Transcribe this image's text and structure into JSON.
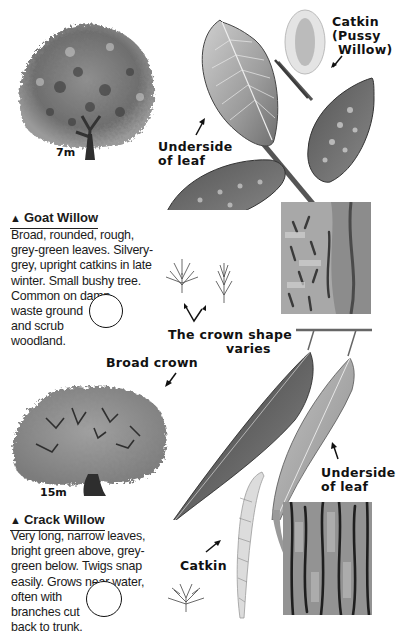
{
  "goat_willow": {
    "size_label": "7m",
    "title_marker": "▲",
    "title": "Goat Willow",
    "description_lines": [
      "Broad, rounded, rough,",
      "grey-green leaves. Silvery-",
      "grey, upright catkins in late",
      "winter. Small bushy tree.",
      "Common on damp",
      "waste ground",
      "and scrub",
      "woodland."
    ],
    "labels": {
      "catkin_line1": "Catkin",
      "catkin_line2": "(Pussy",
      "catkin_line3": "Willow)",
      "underside_line1": "Underside",
      "underside_line2": "of leaf",
      "crown_line1": "The crown shape",
      "crown_line2": "varies"
    }
  },
  "crack_willow": {
    "size_label": "15m",
    "title_marker": "▲",
    "title": "Crack Willow",
    "description_lines": [
      "Very long, narrow leaves,",
      "bright green above, grey-",
      "green below. Twigs snap",
      "easily. Grows near water,",
      "often with",
      "branches cut",
      "back to trunk."
    ],
    "labels": {
      "broad_crown": "Broad crown",
      "underside_line1": "Underside",
      "underside_line2": "of leaf",
      "catkin": "Catkin"
    }
  },
  "colors": {
    "ink": "#111111",
    "foliage_dark": "#4a4a4a",
    "foliage_mid": "#8a8a8a",
    "foliage_light": "#b8b8b8",
    "paper": "#ffffff"
  }
}
